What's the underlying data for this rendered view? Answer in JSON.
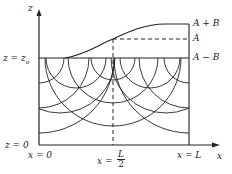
{
  "axes": {
    "vertical": "z",
    "horizontal": "x"
  },
  "left_labels": {
    "z_top": "z = z",
    "z_top_sub": "o",
    "z_zero": "z = 0"
  },
  "right_labels": {
    "upper": "A + B",
    "middle": "A",
    "lower": "A − B"
  },
  "bottom_labels": {
    "x0": "x = 0",
    "xhalf_prefix": "x =",
    "xhalf_num": "L",
    "xhalf_den": "2",
    "xL": "x = L",
    "axis": "x"
  },
  "z_axis_label": "z"
}
